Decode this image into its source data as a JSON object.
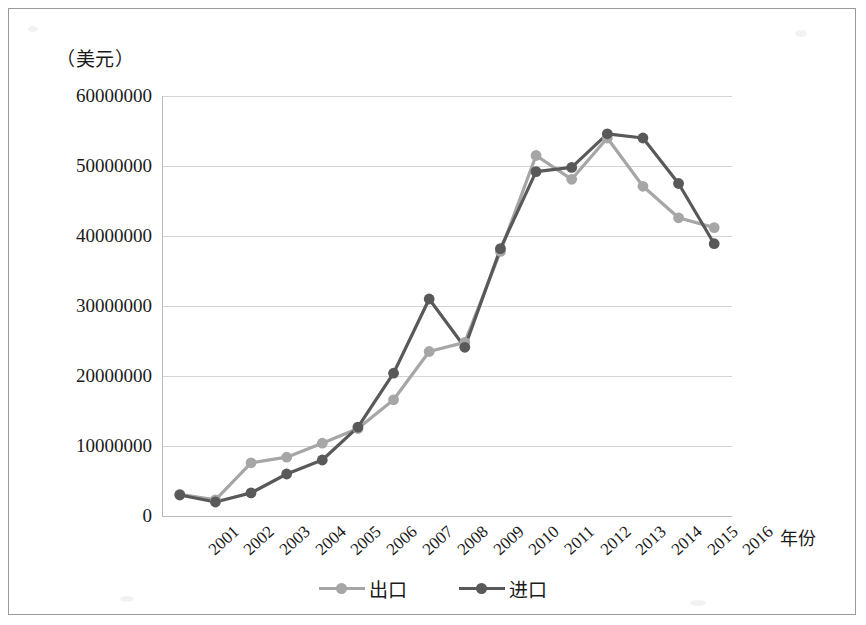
{
  "chart_data": {
    "type": "line",
    "title": "",
    "ylabel": "（美元）",
    "xlabel": "年份",
    "categories": [
      "2001",
      "2002",
      "2003",
      "2004",
      "2005",
      "2006",
      "2007",
      "2008",
      "2009",
      "2010",
      "2011",
      "2012",
      "2013",
      "2014",
      "2015",
      "2016"
    ],
    "ylim": [
      0,
      60000000
    ],
    "y_ticks": [
      "0",
      "10000000",
      "20000000",
      "30000000",
      "40000000",
      "50000000",
      "60000000"
    ],
    "y_tick_values": [
      0,
      10000000,
      20000000,
      30000000,
      40000000,
      50000000,
      60000000
    ],
    "grid": true,
    "legend_position": "bottom",
    "series": [
      {
        "name": "出口",
        "color": "#a6a6a6",
        "values": [
          3100000,
          2300000,
          7600000,
          8400000,
          10400000,
          12500000,
          16600000,
          23500000,
          24800000,
          37800000,
          51500000,
          48100000,
          54000000,
          47100000,
          42600000,
          41200000
        ]
      },
      {
        "name": "进口",
        "color": "#595959",
        "values": [
          3000000,
          2000000,
          3300000,
          6000000,
          8000000,
          12700000,
          20400000,
          31000000,
          24100000,
          38200000,
          49200000,
          49800000,
          54600000,
          54000000,
          47500000,
          38900000
        ]
      }
    ]
  },
  "legend": {
    "items": [
      {
        "label": "出口",
        "color": "#a6a6a6",
        "name": "legend-export"
      },
      {
        "label": "进口",
        "color": "#595959",
        "name": "legend-import"
      }
    ]
  },
  "axes": {
    "y_title": "（美元）",
    "x_title": "年份"
  }
}
